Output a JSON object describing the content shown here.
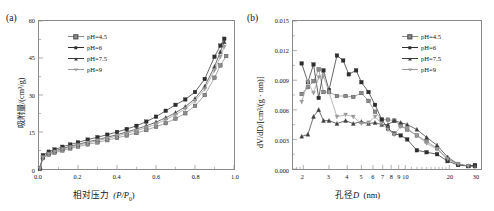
{
  "figure": {
    "panels": [
      {
        "id": "a",
        "label": "(a)",
        "xlabel_cn": "相对压力",
        "xlabel_sym": "(P/P",
        "xlabel_sub": "0",
        "xlabel_end": ")",
        "ylabel": "吸附量/(cm³/g)",
        "x_ticks": [
          "0.0",
          "0.2",
          "0.4",
          "0.6",
          "0.8",
          "1.0"
        ],
        "y_ticks": [
          "0",
          "15",
          "30",
          "45",
          "60"
        ],
        "legend": [
          "pH=4.5",
          "pH=6",
          "pH=7.5",
          "pH=9"
        ]
      },
      {
        "id": "b",
        "label": "(b)",
        "xlabel_cn": "孔径",
        "xlabel_sym": "D",
        "xlabel_unit": "(nm)",
        "ylabel": "dV/dD/[cm³/(g · nm)]",
        "x_ticks": [
          "2",
          "3",
          "4",
          "5",
          "6",
          "7",
          "8",
          "9",
          "10",
          "20",
          "30"
        ],
        "y_ticks": [
          "0.000",
          "0.003",
          "0.006",
          "0.009",
          "0.012",
          "0.015"
        ],
        "legend": [
          "pH=4.5",
          "pH=6",
          "pH=7.5",
          "pH=9"
        ]
      }
    ],
    "colors": {
      "ph45": "#8b8b8b",
      "ph6": "#2e2e2e",
      "ph75": "#3c3c3c",
      "ph9": "#9a9a9a",
      "frame": "#8a8a8a"
    }
  },
  "chart_data": [
    {
      "type": "line",
      "panel": "a",
      "title": "",
      "xlabel": "相对压力 (P/P0)",
      "ylabel": "吸附量/(cm3/g)",
      "xlim": [
        0.0,
        1.0
      ],
      "ylim": [
        0,
        60
      ],
      "xticks": [
        0.0,
        0.2,
        0.4,
        0.6,
        0.8,
        1.0
      ],
      "yticks": [
        0,
        15,
        30,
        45,
        60
      ],
      "grid": false,
      "legend_position": "upper-left-inside",
      "series": [
        {
          "name": "pH=4.5",
          "marker": "square-open",
          "x": [
            0.005,
            0.02,
            0.05,
            0.08,
            0.12,
            0.16,
            0.2,
            0.25,
            0.3,
            0.35,
            0.4,
            0.45,
            0.5,
            0.55,
            0.6,
            0.65,
            0.7,
            0.75,
            0.8,
            0.85,
            0.9,
            0.93,
            0.96
          ],
          "y": [
            0.2,
            4.4,
            5.8,
            6.6,
            7.5,
            8.3,
            9.1,
            10.0,
            10.8,
            11.7,
            12.6,
            13.6,
            14.6,
            15.8,
            17.1,
            18.6,
            20.4,
            22.6,
            25.6,
            30.0,
            37.0,
            42.0,
            45.8
          ]
        },
        {
          "name": "pH=6",
          "marker": "square-filled",
          "x": [
            0.005,
            0.02,
            0.05,
            0.08,
            0.12,
            0.16,
            0.2,
            0.25,
            0.3,
            0.35,
            0.4,
            0.45,
            0.5,
            0.55,
            0.6,
            0.65,
            0.7,
            0.75,
            0.8,
            0.85,
            0.9,
            0.93,
            0.95
          ],
          "y": [
            0.2,
            5.6,
            7.0,
            7.9,
            9.0,
            9.9,
            10.8,
            11.9,
            12.9,
            13.9,
            15.0,
            16.2,
            17.5,
            19.2,
            21.2,
            23.6,
            26.0,
            28.2,
            31.2,
            36.5,
            45.5,
            50.0,
            52.8
          ]
        },
        {
          "name": "pH=7.5",
          "marker": "triangle-up",
          "x": [
            0.005,
            0.02,
            0.05,
            0.08,
            0.12,
            0.16,
            0.2,
            0.25,
            0.3,
            0.35,
            0.4,
            0.45,
            0.5,
            0.55,
            0.6,
            0.65,
            0.7,
            0.75,
            0.8,
            0.85,
            0.9,
            0.93,
            0.95
          ],
          "y": [
            0.2,
            5.0,
            6.4,
            7.3,
            8.3,
            9.2,
            10.0,
            11.0,
            11.9,
            12.9,
            13.9,
            15.0,
            16.2,
            17.5,
            19.0,
            20.8,
            22.8,
            25.2,
            28.5,
            33.5,
            41.5,
            47.5,
            51.5
          ]
        },
        {
          "name": "pH=9",
          "marker": "triangle-down",
          "x": [
            0.005,
            0.02,
            0.05,
            0.08,
            0.12,
            0.16,
            0.2,
            0.25,
            0.3,
            0.35,
            0.4,
            0.45,
            0.5,
            0.55,
            0.6,
            0.65,
            0.7,
            0.75,
            0.8,
            0.85,
            0.9,
            0.93,
            0.95
          ],
          "y": [
            0.2,
            4.7,
            6.1,
            7.0,
            8.0,
            8.8,
            9.6,
            10.6,
            11.5,
            12.4,
            13.4,
            14.4,
            15.5,
            16.8,
            18.2,
            20.0,
            22.0,
            24.4,
            27.6,
            32.4,
            40.0,
            45.5,
            49.5
          ]
        }
      ]
    },
    {
      "type": "line",
      "panel": "b",
      "title": "",
      "xlabel": "孔径D (nm)",
      "ylabel": "dV/dD/[cm3/(g · nm)]",
      "xscale": "log",
      "xlim": [
        1.7,
        33
      ],
      "ylim": [
        0.0,
        0.015
      ],
      "xticks": [
        2,
        3,
        4,
        5,
        6,
        7,
        8,
        9,
        10,
        20,
        30
      ],
      "yticks": [
        0.0,
        0.003,
        0.006,
        0.009,
        0.012,
        0.015
      ],
      "grid": false,
      "legend_position": "upper-right-inside",
      "series": [
        {
          "name": "pH=4.5",
          "marker": "square-open",
          "x": [
            1.95,
            2.15,
            2.35,
            2.55,
            2.75,
            3.0,
            3.4,
            3.9,
            4.4,
            5.0,
            5.6,
            6.2,
            6.9,
            7.6,
            8.4,
            9.3,
            10.3,
            12.0,
            14.0,
            16.5,
            19.5,
            23.0,
            27.0,
            30.0
          ],
          "y": [
            0.0076,
            0.0083,
            0.0089,
            0.0101,
            0.0078,
            0.0078,
            0.0074,
            0.0074,
            0.0073,
            0.0077,
            0.0069,
            0.0058,
            0.005,
            0.005,
            0.0049,
            0.0044,
            0.004,
            0.0034,
            0.0028,
            0.0021,
            0.001,
            0.0005,
            0.0003,
            0.0003
          ]
        },
        {
          "name": "pH=6",
          "marker": "square-filled",
          "x": [
            1.95,
            2.15,
            2.35,
            2.55,
            2.75,
            3.0,
            3.4,
            3.75,
            4.1,
            4.6,
            5.0,
            5.6,
            6.2,
            6.9,
            7.6,
            8.4,
            9.3,
            10.3,
            12.0,
            14.0,
            16.5,
            19.5,
            23.0,
            27.0,
            30.0
          ],
          "y": [
            0.0107,
            0.0088,
            0.0106,
            0.0072,
            0.01,
            0.008,
            0.0115,
            0.011,
            0.0096,
            0.01,
            0.0088,
            0.0078,
            0.0065,
            0.005,
            0.0041,
            0.0036,
            0.0034,
            0.003,
            0.0019,
            0.0017,
            0.0015,
            0.0008,
            0.0004,
            0.0003,
            0.0004
          ]
        },
        {
          "name": "pH=7.5",
          "marker": "triangle-up",
          "x": [
            1.95,
            2.15,
            2.35,
            2.55,
            2.75,
            3.0,
            3.4,
            3.9,
            4.4,
            5.0,
            5.6,
            6.2,
            6.9,
            7.6,
            8.4,
            9.3,
            10.3,
            12.0,
            14.0,
            16.5,
            19.5,
            23.0,
            27.0,
            30.0
          ],
          "y": [
            0.0033,
            0.0035,
            0.0053,
            0.006,
            0.0049,
            0.0049,
            0.0046,
            0.0049,
            0.0046,
            0.0048,
            0.0046,
            0.0047,
            0.0045,
            0.0045,
            0.0049,
            0.0047,
            0.0045,
            0.004,
            0.0032,
            0.0024,
            0.0012,
            0.0005,
            0.0003,
            0.0003
          ]
        },
        {
          "name": "pH=9",
          "marker": "triangle-down",
          "x": [
            1.95,
            2.15,
            2.35,
            2.55,
            2.75,
            3.0,
            3.4,
            3.9,
            4.4,
            5.0,
            5.6,
            6.2,
            6.9,
            7.6,
            8.4,
            9.3,
            10.3,
            12.0,
            14.0,
            16.5,
            19.5,
            23.0,
            27.0
          ],
          "y": [
            0.0068,
            0.0088,
            0.0077,
            0.0093,
            0.0094,
            0.0078,
            0.0053,
            0.0055,
            0.0053,
            0.0046,
            0.0047,
            0.0053,
            0.0046,
            0.004,
            0.0035,
            0.0043,
            0.0041,
            0.0034,
            0.0026,
            0.002,
            0.001,
            0.0005,
            0.0003
          ]
        }
      ]
    }
  ]
}
